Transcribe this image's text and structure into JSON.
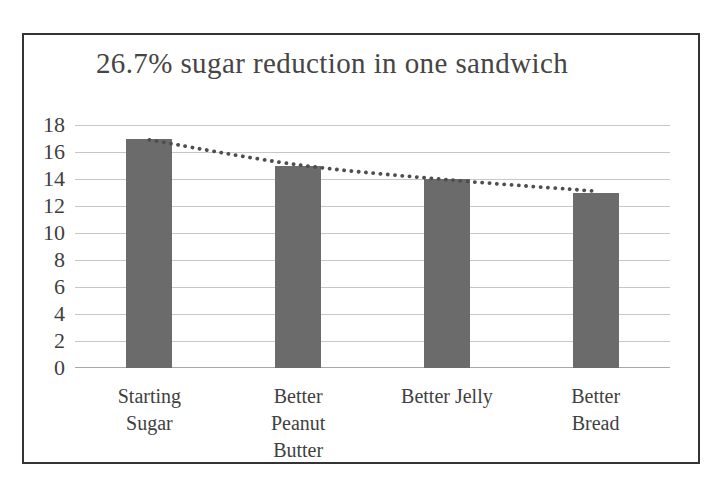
{
  "window": {
    "background": "#ffffff"
  },
  "chart": {
    "title": "26.7% sugar reduction in one sandwich",
    "colors": {
      "bar": "#6b6b6b",
      "gridline": "#c7c7c7",
      "baseline": "#a8a8a8",
      "trendline": "#4e4e4e",
      "frame_border": "#343434",
      "title_text": "#454545",
      "axis_text": "#3f3f3f"
    }
  },
  "chart_data": {
    "type": "bar",
    "title": "26.7% sugar reduction in one sandwich",
    "categories": [
      "Starting Sugar",
      "Better Peanut Butter",
      "Better Jelly",
      "Better Bread"
    ],
    "category_label_lines": [
      [
        "Starting",
        "Sugar"
      ],
      [
        "Better",
        "Peanut",
        "Butter"
      ],
      [
        "Better Jelly"
      ],
      [
        "Better",
        "Bread"
      ]
    ],
    "values": [
      17,
      15,
      14,
      13
    ],
    "xlabel": "",
    "ylabel": "",
    "ylim": [
      0,
      18
    ],
    "yticks": [
      0,
      2,
      4,
      6,
      8,
      10,
      12,
      14,
      16,
      18
    ],
    "grid": true,
    "legend": false,
    "trendline": {
      "type": "logarithmic",
      "style": "dotted",
      "values": [
        16.9,
        15.05,
        13.95,
        13.1
      ]
    }
  }
}
